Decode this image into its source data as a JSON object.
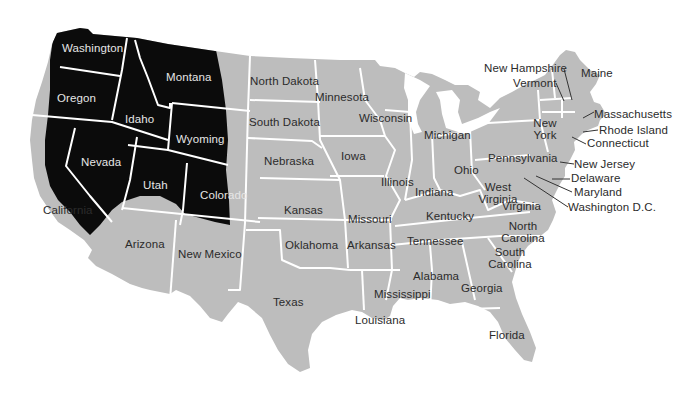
{
  "map": {
    "title": "United States map with highlighted western region",
    "colors": {
      "land": "#bdbdbd",
      "highlight": "#0b0b0b",
      "border": "#ffffff",
      "label": "#2b2b2b",
      "label_on_highlight": "#e6e6e6",
      "background": "#ffffff"
    },
    "highlighted_states": [
      "Washington",
      "Oregon",
      "Idaho",
      "Montana",
      "Wyoming",
      "Nevada",
      "Utah",
      "Colorado",
      "California (eastern part)"
    ],
    "labels": {
      "washington": "Washington",
      "oregon": "Oregon",
      "idaho": "Idaho",
      "montana": "Montana",
      "wyoming": "Wyoming",
      "nevada": "Nevada",
      "utah": "Utah",
      "colorado": "Colorado",
      "california": "California",
      "arizona": "Arizona",
      "new_mexico": "New Mexico",
      "texas": "Texas",
      "north_dakota": "North Dakota",
      "south_dakota": "South Dakota",
      "nebraska": "Nebraska",
      "kansas": "Kansas",
      "oklahoma": "Oklahoma",
      "minnesota": "Minnesota",
      "iowa": "Iowa",
      "missouri": "Missouri",
      "arkansas": "Arkansas",
      "louisiana": "Louisiana",
      "wisconsin": "Wisconsin",
      "illinois": "Illinois",
      "michigan": "Michigan",
      "indiana": "Indiana",
      "ohio": "Ohio",
      "kentucky": "Kentucky",
      "tennessee": "Tennessee",
      "mississippi": "Mississippi",
      "alabama": "Alabama",
      "georgia": "Georgia",
      "florida": "Florida",
      "south_carolina": "South Carolina",
      "north_carolina": "North Carolina",
      "virginia": "Virginia",
      "west_virginia": "West Virginia",
      "pennsylvania": "Pennsylvania",
      "new_york": "New York",
      "new_jersey": "New Jersey",
      "delaware": "Delaware",
      "maryland": "Maryland",
      "washington_dc": "Washington D.C.",
      "connecticut": "Connecticut",
      "rhode_island": "Rhode Island",
      "massachusetts": "Massachusetts",
      "vermont": "Vermont",
      "new_hampshire": "New Hampshire",
      "maine": "Maine"
    }
  }
}
